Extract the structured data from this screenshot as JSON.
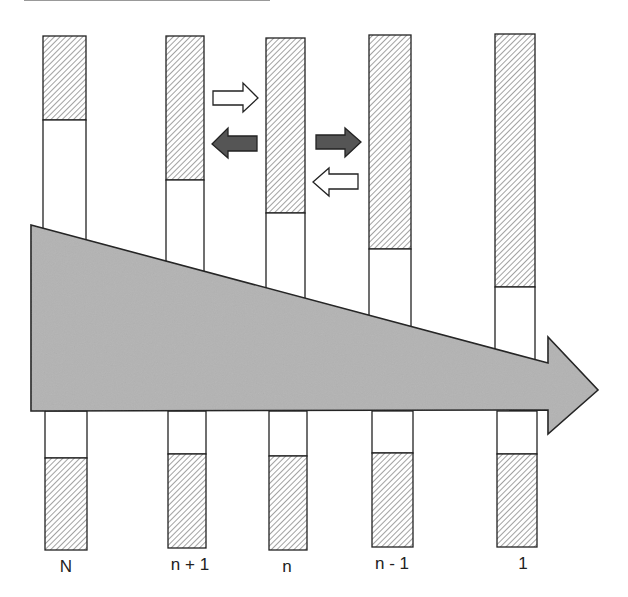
{
  "diagram": {
    "columns": [
      {
        "label": "N",
        "x": 43,
        "w": 43,
        "top": 36,
        "hatch_top_end": 120,
        "bottom_white_start": 411,
        "bottom_hatch_start": 458,
        "bottom_end": 550,
        "label_x": 66
      },
      {
        "label": "n + 1",
        "x": 166,
        "w": 38,
        "top": 36,
        "hatch_top_end": 180,
        "bottom_white_start": 411,
        "bottom_hatch_start": 454,
        "bottom_end": 548,
        "label_x": 190
      },
      {
        "label": "n",
        "x": 266,
        "w": 39,
        "top": 38,
        "hatch_top_end": 213,
        "bottom_white_start": 411,
        "bottom_hatch_start": 456,
        "bottom_end": 550,
        "label_x": 287
      },
      {
        "label": "n - 1",
        "x": 369,
        "w": 42,
        "top": 35,
        "hatch_top_end": 249,
        "bottom_white_start": 411,
        "bottom_hatch_start": 453,
        "bottom_end": 547,
        "label_x": 392
      },
      {
        "label": "1",
        "x": 495,
        "w": 40,
        "top": 34,
        "hatch_top_end": 287,
        "bottom_white_start": 411,
        "bottom_hatch_start": 454,
        "bottom_end": 547,
        "label_x": 523
      }
    ],
    "exchange_arrows": [
      {
        "name": "light-right",
        "direction": "right",
        "fill": "#ffffff"
      },
      {
        "name": "dark-left",
        "direction": "left",
        "fill": "#555555"
      },
      {
        "name": "dark-right",
        "direction": "right",
        "fill": "#555555"
      },
      {
        "name": "light-left",
        "direction": "left",
        "fill": "#ffffff"
      }
    ],
    "main_arrow": {
      "direction": "right",
      "fill": "#b3b3b3"
    },
    "colors": {
      "hatch": "#9a9a9a",
      "stroke": "#222222",
      "dark_arrow": "#555555",
      "main_arrow": "#b3b3b3"
    }
  }
}
